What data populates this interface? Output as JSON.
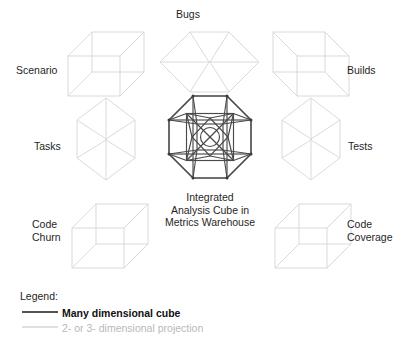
{
  "diagram": {
    "title_center": "Integrated\nAnalysis Cube in\nMetrics Warehouse",
    "source_cubes": [
      {
        "key": "scenario",
        "label": "Scenario",
        "projection": "oblique-cube-left"
      },
      {
        "key": "bugs",
        "label": "Bugs",
        "projection": "hex-cube-horizontal"
      },
      {
        "key": "builds",
        "label": "Builds",
        "projection": "oblique-cube-right"
      },
      {
        "key": "tasks",
        "label": "Tasks",
        "projection": "hex-cube-vertical"
      },
      {
        "key": "tests",
        "label": "Tests",
        "projection": "hex-cube-vertical"
      },
      {
        "key": "code_churn",
        "label": "Code\nChurn",
        "projection": "oblique-cube-left"
      },
      {
        "key": "code_coverage",
        "label": "Code\nCoverage",
        "projection": "oblique-cube-right"
      }
    ],
    "legend": {
      "title": "Legend:",
      "entries": [
        {
          "label": "Many dimensional cube",
          "color": "#1a1a1a",
          "swatch": "solid-thick-dark"
        },
        {
          "label": "2- or 3- dimensional projection",
          "color": "#c9c9c9",
          "swatch": "solid-thin-light"
        }
      ]
    },
    "colors": {
      "background": "#ffffff",
      "many_dimensional_cube": "#3a3a3a",
      "projection": "#d4d4d4",
      "text": "#1f1f1f",
      "text_muted": "#b9b9b9"
    }
  }
}
